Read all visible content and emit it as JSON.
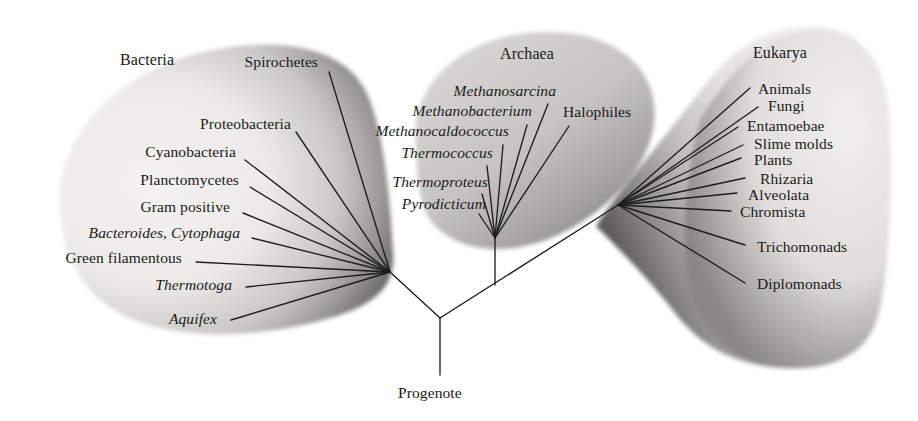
{
  "figure": {
    "type": "phylogenetic-tree",
    "root_label": "Progenote",
    "domains": [
      {
        "key": "bacteria",
        "label": "Bacteria"
      },
      {
        "key": "archaea",
        "label": "Archaea"
      },
      {
        "key": "eukarya",
        "label": "Eukarya"
      }
    ]
  },
  "colors": {
    "line": "#1d1d1d",
    "text": "#1a1a1a",
    "blob_light": "#f0eeec",
    "blob_mid": "#bdbbba",
    "blob_dark": "#6e6c6b",
    "background": "#ffffff"
  },
  "bacteria": {
    "domain_label": "Bacteria",
    "domain_label_pos": {
      "x": 120,
      "y": 60
    },
    "fan_origin": {
      "x": 390,
      "y": 272
    },
    "taxa": [
      {
        "name": "Spirochetes",
        "italic": false,
        "label_x": 318,
        "label_y": 66,
        "anchor": "end",
        "tip_x": 329,
        "tip_y": 72
      },
      {
        "name": "Proteobacteria",
        "italic": false,
        "label_x": 291,
        "label_y": 128,
        "anchor": "end",
        "tip_x": 296,
        "tip_y": 132
      },
      {
        "name": "Cyanobacteria",
        "italic": false,
        "label_x": 236,
        "label_y": 156,
        "anchor": "end",
        "tip_x": 245,
        "tip_y": 160
      },
      {
        "name": "Planctomycetes",
        "italic": false,
        "label_x": 239,
        "label_y": 184,
        "anchor": "end",
        "tip_x": 250,
        "tip_y": 187
      },
      {
        "name": "Gram positive",
        "italic": false,
        "label_x": 230,
        "label_y": 211,
        "anchor": "end",
        "tip_x": 243,
        "tip_y": 213
      },
      {
        "name": "Bacteroides, Cytophaga",
        "italic": true,
        "label_x": 240,
        "label_y": 237,
        "anchor": "end",
        "tip_x": 252,
        "tip_y": 238
      },
      {
        "name": "Green filamentous",
        "italic": false,
        "label_x": 182,
        "label_y": 262,
        "anchor": "end",
        "tip_x": 196,
        "tip_y": 262
      },
      {
        "name": "Thermotoga",
        "italic": true,
        "label_x": 232,
        "label_y": 289,
        "anchor": "end",
        "tip_x": 246,
        "tip_y": 287
      },
      {
        "name": "Aquifex",
        "italic": true,
        "label_x": 217,
        "label_y": 323,
        "anchor": "end",
        "tip_x": 231,
        "tip_y": 320
      }
    ]
  },
  "archaea": {
    "domain_label": "Archaea",
    "domain_label_pos": {
      "x": 510,
      "y": 57
    },
    "fan_origin": {
      "x": 495,
      "y": 238
    },
    "trunk_bottom": {
      "x": 495,
      "y": 285
    },
    "taxa": [
      {
        "name": "Methanosarcina",
        "italic": true,
        "label_x": 556,
        "label_y": 95,
        "anchor": "end",
        "tip_x": 548,
        "tip_y": 104
      },
      {
        "name": "Methanobacterium",
        "italic": true,
        "label_x": 532,
        "label_y": 115,
        "anchor": "end",
        "tip_x": 527,
        "tip_y": 125
      },
      {
        "name": "Halophiles",
        "italic": false,
        "label_x": 563,
        "label_y": 116,
        "anchor": "start",
        "tip_x": 569,
        "tip_y": 126
      },
      {
        "name": "Methanocaldococcus",
        "italic": true,
        "label_x": 509,
        "label_y": 135,
        "anchor": "end",
        "tip_x": 503,
        "tip_y": 145
      },
      {
        "name": "Thermococcus",
        "italic": true,
        "label_x": 493,
        "label_y": 157,
        "anchor": "end",
        "tip_x": 487,
        "tip_y": 166
      },
      {
        "name": "Thermoproteus",
        "italic": true,
        "label_x": 488,
        "label_y": 186,
        "anchor": "end",
        "tip_x": 482,
        "tip_y": 194
      },
      {
        "name": "Pyrodicticum",
        "italic": true,
        "label_x": 486,
        "label_y": 208,
        "anchor": "end",
        "tip_x": 479,
        "tip_y": 214
      }
    ]
  },
  "eukarya": {
    "domain_label": "Eukarya",
    "domain_label_pos": {
      "x": 757,
      "y": 55
    },
    "fan_origin": {
      "x": 618,
      "y": 205
    },
    "taxa": [
      {
        "name": "Animals",
        "italic": false,
        "label_x": 758,
        "label_y": 93,
        "anchor": "start",
        "tip_x": 750,
        "tip_y": 88
      },
      {
        "name": "Fungi",
        "italic": false,
        "label_x": 768,
        "label_y": 110,
        "anchor": "start",
        "tip_x": 758,
        "tip_y": 107
      },
      {
        "name": "Entamoebae",
        "italic": false,
        "label_x": 747,
        "label_y": 130,
        "anchor": "start",
        "tip_x": 738,
        "tip_y": 127
      },
      {
        "name": "Slime molds",
        "italic": false,
        "label_x": 754,
        "label_y": 148,
        "anchor": "start",
        "tip_x": 743,
        "tip_y": 145
      },
      {
        "name": "Plants",
        "italic": false,
        "label_x": 754,
        "label_y": 164,
        "anchor": "start",
        "tip_x": 741,
        "tip_y": 158
      },
      {
        "name": "Rhizaria",
        "italic": false,
        "label_x": 760,
        "label_y": 183,
        "anchor": "start",
        "tip_x": 745,
        "tip_y": 178
      },
      {
        "name": "Alveolata",
        "italic": false,
        "label_x": 748,
        "label_y": 199,
        "anchor": "start",
        "tip_x": 737,
        "tip_y": 193
      },
      {
        "name": "Chromista",
        "italic": false,
        "label_x": 740,
        "label_y": 216,
        "anchor": "start",
        "tip_x": 731,
        "tip_y": 211
      },
      {
        "name": "Trichomonads",
        "italic": false,
        "label_x": 757,
        "label_y": 251,
        "anchor": "start",
        "tip_x": 745,
        "tip_y": 245
      },
      {
        "name": "Diplomonads",
        "italic": false,
        "label_x": 757,
        "label_y": 288,
        "anchor": "start",
        "tip_x": 745,
        "tip_y": 283
      }
    ]
  },
  "root": {
    "label": "Progenote",
    "label_pos": {
      "x": 440,
      "y": 396
    },
    "node": {
      "x": 440,
      "y": 318
    },
    "stem_bottom": {
      "x": 440,
      "y": 375
    },
    "left_branch_end": {
      "x": 390,
      "y": 272
    },
    "right_branch_end": {
      "x": 618,
      "y": 205
    }
  }
}
